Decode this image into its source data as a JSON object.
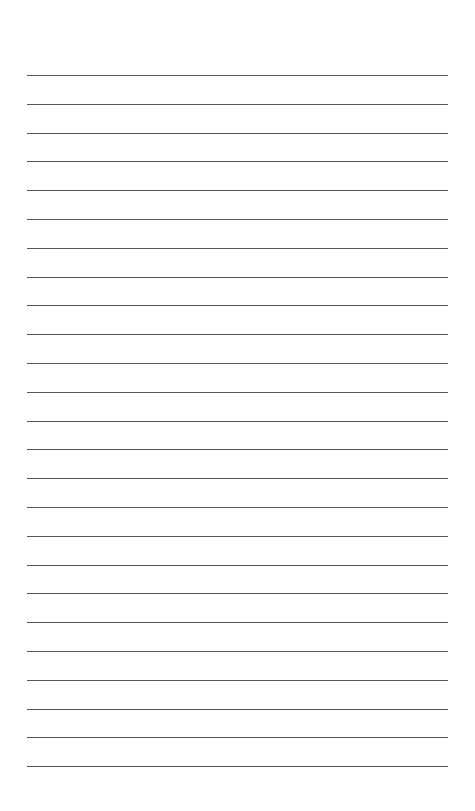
{
  "page": {
    "type": "lined-paper",
    "background": "#ffffff",
    "line_color": "#555555",
    "line_count": 25,
    "first_line_y": 75,
    "line_spacing": 28.8,
    "line_left": 27,
    "line_width": 421
  }
}
